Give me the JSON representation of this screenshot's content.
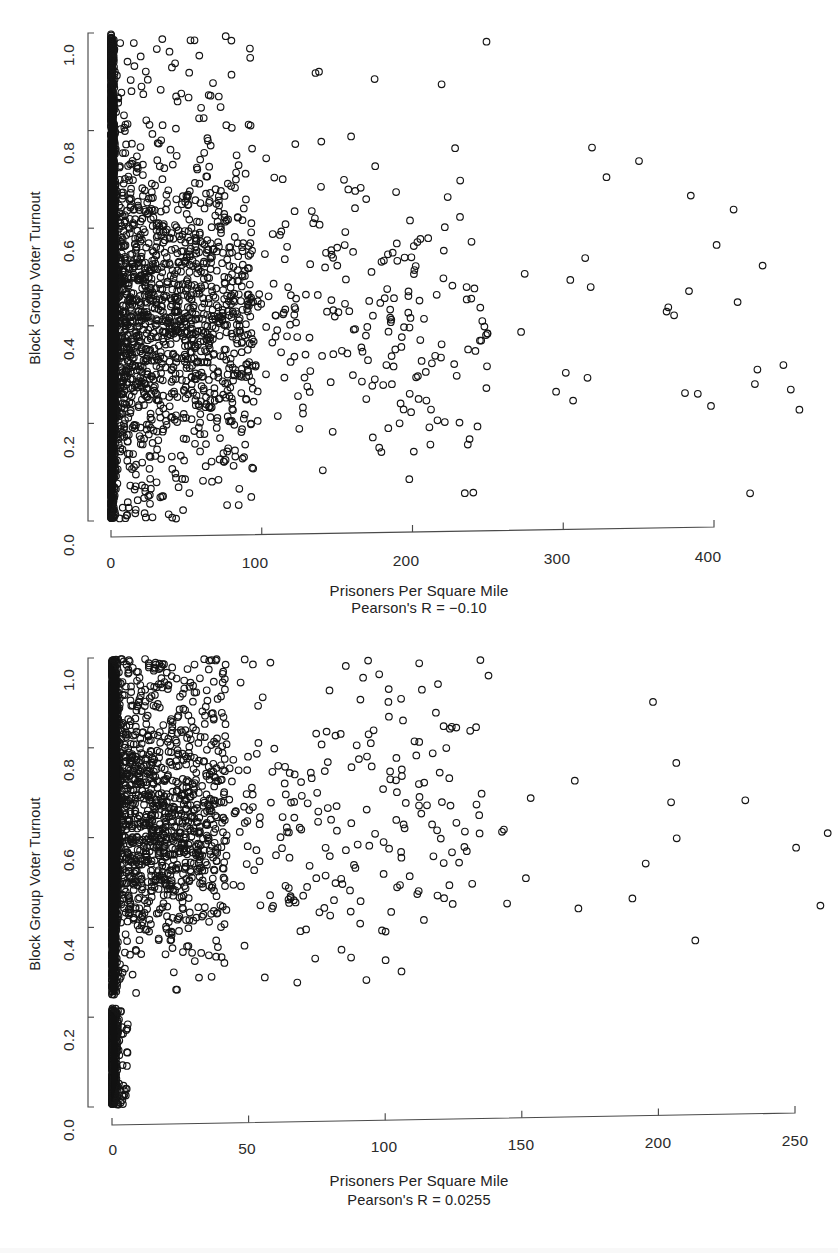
{
  "document": {
    "kind": "scatterplot-figure-pair",
    "background": "#ffffff",
    "point_color": "#151515",
    "axis_color": "#4a4a4a"
  },
  "panels": [
    {
      "id": "panel-1",
      "y_axis_title": "Block Group Voter Turnout",
      "x_axis_title": "Prisoners Per Square Mile",
      "subtitle": "Pearson's R = −0.10",
      "y_ticks": [
        "0.0",
        "0.2",
        "0.4",
        "0.6",
        "0.8",
        "1.0"
      ],
      "x_ticks": [
        "0",
        "100",
        "200",
        "300",
        "400"
      ]
    },
    {
      "id": "panel-2",
      "y_axis_title": "Block Group Voter Turnout",
      "x_axis_title": "Prisoners Per Square Mile",
      "subtitle": "Pearson's R = 0.0255",
      "y_ticks": [
        "0.0",
        "0.2",
        "0.4",
        "0.6",
        "0.8",
        "1.0"
      ],
      "x_ticks": [
        "0",
        "50",
        "100",
        "150",
        "200",
        "250"
      ]
    }
  ],
  "chart_data": [
    {
      "type": "scatter",
      "title": "",
      "xlabel": "Prisoners Per Square Mile",
      "ylabel": "Block Group Voter Turnout",
      "annotation": "Pearson's R = −0.10",
      "pearson_r": -0.1,
      "xlim": [
        0,
        462
      ],
      "ylim": [
        0.0,
        1.0
      ],
      "x_ticks": [
        0,
        100,
        200,
        300,
        400
      ],
      "y_ticks": [
        0.0,
        0.2,
        0.4,
        0.6,
        0.8,
        1.0
      ],
      "grid": false,
      "legend": null,
      "marker": "open-circle",
      "n_points": 4200,
      "distribution": {
        "x": "heavy-right-skew, mode at 0, dense mass below 40, long thin tail to ~460",
        "y": "broad, centered near 0.42, spread 0.0-1.0, dense vertical band at x~0 spanning full range"
      }
    },
    {
      "type": "scatter",
      "title": "",
      "xlabel": "Prisoners Per Square Mile",
      "ylabel": "Block Group Voter Turnout",
      "annotation": "Pearson's R = 0.0255",
      "pearson_r": 0.0255,
      "xlim": [
        0,
        262
      ],
      "ylim": [
        0.0,
        1.0
      ],
      "x_ticks": [
        0,
        50,
        100,
        150,
        200,
        250
      ],
      "y_ticks": [
        0.0,
        0.2,
        0.4,
        0.6,
        0.8,
        1.0
      ],
      "grid": false,
      "legend": null,
      "marker": "open-circle",
      "n_points": 3600,
      "distribution": {
        "x": "heavy-right-skew, mode at 0, dense mass below 25, thin tail to ~260",
        "y": "bimodal: main cloud 0.25-1.0 centered ~0.65, plus low cluster 0.0-0.22 confined near x~0"
      }
    }
  ]
}
